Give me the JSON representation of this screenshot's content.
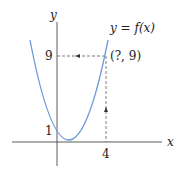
{
  "diagram": {
    "type": "function-graph",
    "axes": {
      "x_label": "x",
      "y_label": "y"
    },
    "curve": {
      "label": "y = f(x)",
      "color": "#5b8fd6",
      "form": "parabola",
      "vertex_x": 1,
      "samples": [
        [
          -1.4,
          5.76
        ],
        [
          0,
          1
        ],
        [
          1,
          0
        ],
        [
          2,
          1
        ],
        [
          4,
          9
        ],
        [
          4.2,
          10.24
        ]
      ]
    },
    "ticks": {
      "y_values": [
        "1",
        "9"
      ],
      "x_values": [
        "4"
      ]
    },
    "point": {
      "label": "(?, 9)",
      "x": 4,
      "y": 9
    },
    "guides": {
      "horizontal": "dashed line from y-axis at 9 to point, arrow pointing left",
      "vertical": "dashed line from x=4 up to point, arrow pointing up"
    }
  }
}
